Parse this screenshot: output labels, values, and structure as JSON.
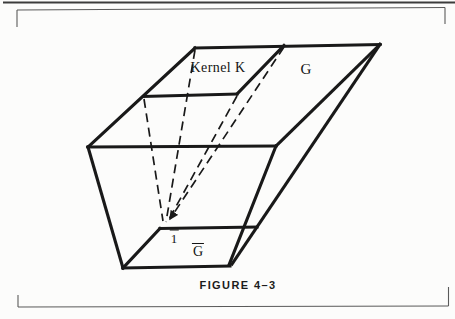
{
  "figure": {
    "caption": "FIGURE 4–3",
    "labels": {
      "kernel_k": "Kernel K",
      "group_g": "G",
      "identity_1bar": {
        "text": "1",
        "overbar": true
      },
      "quotient_gbar": {
        "text": "G",
        "overbar": true
      }
    },
    "colors": {
      "ink": "#191919",
      "frame": "#5a5a5a",
      "top_rule": "#3c3c3c",
      "paper": "#fcfcfb"
    }
  }
}
